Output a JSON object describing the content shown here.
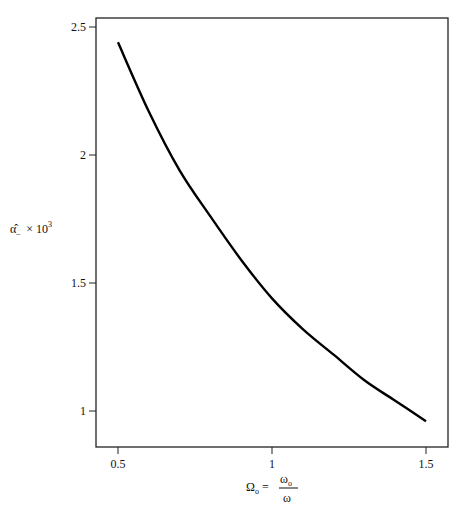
{
  "chart_data": {
    "type": "line",
    "title": "",
    "xlabel": "Ω_o = ω_o / ω",
    "ylabel": "α̂_ × 10^3",
    "xlim": [
      0.45,
      1.55
    ],
    "ylim": [
      0.86,
      2.53
    ],
    "grid": false,
    "legend": null,
    "x_ticks": [
      0.5,
      1,
      1.5
    ],
    "x_tick_labels": [
      "0.5",
      "1",
      "1.5"
    ],
    "y_ticks": [
      1,
      1.5,
      2,
      2.5
    ],
    "y_tick_labels": [
      "1",
      "1.5",
      "2",
      "2.5"
    ],
    "series": [
      {
        "name": "alpha_hat",
        "x": [
          0.5,
          0.6,
          0.7,
          0.8,
          0.9,
          1.0,
          1.1,
          1.2,
          1.3,
          1.4,
          1.5
        ],
        "values": [
          2.44,
          2.17,
          1.94,
          1.76,
          1.59,
          1.44,
          1.32,
          1.22,
          1.12,
          1.04,
          0.96
        ]
      }
    ]
  },
  "labels": {
    "y_main": "α̂",
    "y_sub": "–",
    "y_times": "× 10",
    "y_exp": "3",
    "x_lhs": "Ω",
    "x_lhs_sub": "o",
    "x_eq": "=",
    "x_num": "ω",
    "x_num_sub": "o",
    "x_den": "ω"
  }
}
